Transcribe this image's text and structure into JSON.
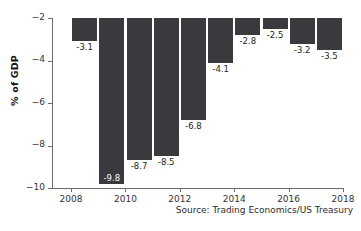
{
  "chart_data": {
    "type": "bar",
    "title": "",
    "subtitle": "",
    "xlabel": "",
    "ylabel": "% of GDP",
    "categories": [
      2008,
      2009,
      2010,
      2011,
      2012,
      2013,
      2014,
      2015,
      2016,
      2017
    ],
    "values": [
      -3.1,
      -9.8,
      -8.7,
      -8.5,
      -6.8,
      -4.1,
      -2.8,
      -2.5,
      -3.2,
      -3.5
    ],
    "data_labels": [
      "-3.1",
      "-9.8",
      "-8.7",
      "-8.5",
      "-6.8",
      "-4.1",
      "-2.8",
      "-2.5",
      "-3.2",
      "-3.5"
    ],
    "ylim": [
      -10,
      -2
    ],
    "xlim": [
      2007.3,
      2018.0
    ],
    "yticks": [
      -2,
      -4,
      -6,
      -8,
      -10
    ],
    "ytick_labels": [
      "−2",
      "−4",
      "−6",
      "−8",
      "−10"
    ],
    "xticks": [
      2008,
      2010,
      2012,
      2014,
      2016,
      2018
    ],
    "xtick_labels": [
      "2008",
      "2010",
      "2012",
      "2014",
      "2016",
      "2018"
    ],
    "grid": false,
    "legend": null,
    "bar_color": "#3a3a3e",
    "axis_color": "#6b6b70",
    "background": "#ffffff",
    "annotations": [
      {
        "name": "source-note",
        "text": "Source: Trading Economics/US Treasury"
      }
    ]
  },
  "footer": {
    "source": "Source: Trading Economics/US Treasury"
  }
}
